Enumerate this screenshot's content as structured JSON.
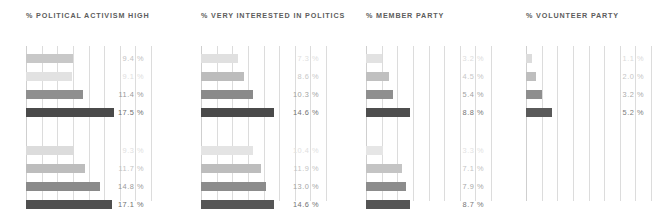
{
  "chart_data": {
    "type": "bar",
    "title": "",
    "orientation": "horizontal",
    "layout": "small-multiples",
    "grid": true,
    "gridline_count": 9,
    "legend": "none",
    "xlabel": "",
    "ylabel": "",
    "xlim": [
      0,
      24
    ],
    "value_suffix": "%",
    "group_count": 2,
    "bars_per_group": 4,
    "panels": [
      {
        "title": "% POLITICAL ACTIVISM HIGH",
        "groups": [
          {
            "values": [
              9.4,
              9.1,
              11.4,
              17.5
            ],
            "labels": [
              "9.4 %",
              "9.1 %",
              "11.4 %",
              "17.5 %"
            ],
            "shades": [
              "#c8c8c8",
              "#e2e2e2",
              "#8f8f8f",
              "#4a4a4a"
            ],
            "label_shades": [
              "#c2c2c2",
              "#dedede",
              "#9a9a9a",
              "#6f6f6f"
            ]
          },
          {
            "values": [
              9.3,
              11.7,
              14.8,
              17.1
            ],
            "labels": [
              "9.3 %",
              "11.7 %",
              "14.8 %",
              "17.1 %"
            ],
            "shades": [
              "#dcdcdc",
              "#bdbdbd",
              "#8a8a8a",
              "#4f4f4f"
            ],
            "label_shades": [
              "#e0e0e0",
              "#c2c2c2",
              "#9a9a9a",
              "#6f6f6f"
            ]
          }
        ]
      },
      {
        "title": "% VERY INTERESTED IN POLITICS",
        "groups": [
          {
            "values": [
              7.3,
              8.6,
              10.3,
              14.6
            ],
            "labels": [
              "7.3 %",
              "8.6 %",
              "10.3 %",
              "14.6 %"
            ],
            "shades": [
              "#e0e0e0",
              "#bcbcbc",
              "#8a8a8a",
              "#4a4a4a"
            ],
            "label_shades": [
              "#dedede",
              "#c8c8c8",
              "#a2a2a2",
              "#727272"
            ]
          },
          {
            "values": [
              10.4,
              11.9,
              13.0,
              14.6
            ],
            "labels": [
              "10.4 %",
              "11.9 %",
              "13.0 %",
              "14.6 %"
            ],
            "shades": [
              "#e4e4e4",
              "#bdbdbd",
              "#8c8c8c",
              "#565656"
            ],
            "label_shades": [
              "#e0e0e0",
              "#c4c4c4",
              "#a4a4a4",
              "#727272"
            ]
          }
        ]
      },
      {
        "title": "% MEMBER PARTY",
        "groups": [
          {
            "values": [
              3.2,
              4.5,
              5.4,
              8.8
            ],
            "labels": [
              "3.2 %",
              "4.5 %",
              "5.4 %",
              "8.8 %"
            ],
            "shades": [
              "#e2e2e2",
              "#c0c0c0",
              "#8f8f8f",
              "#4e4e4e"
            ],
            "label_shades": [
              "#dcdcdc",
              "#c6c6c6",
              "#a2a2a2",
              "#767676"
            ]
          },
          {
            "values": [
              3.3,
              7.1,
              7.9,
              8.7
            ],
            "labels": [
              "3.3 %",
              "7.1 %",
              "7.9 %",
              "8.7 %"
            ],
            "shades": [
              "#e6e6e6",
              "#c4c4c4",
              "#8c8c8c",
              "#545454"
            ],
            "label_shades": [
              "#e2e2e2",
              "#c4c4c4",
              "#a6a6a6",
              "#767676"
            ]
          }
        ]
      },
      {
        "title": "% VOLUNTEER PARTY",
        "groups": [
          {
            "values": [
              1.1,
              2.0,
              3.2,
              5.2
            ],
            "labels": [
              "1.1 %",
              "2.0 %",
              "3.2 %",
              "5.2 %"
            ],
            "shades": [
              "#dcdcdc",
              "#bebebe",
              "#8e8e8e",
              "#5a5a5a"
            ],
            "label_shades": [
              "#dadada",
              "#c6c6c6",
              "#aaaaaa",
              "#7c7c7c"
            ]
          },
          {
            "values": [],
            "labels": [],
            "shades": [],
            "label_shades": []
          }
        ]
      }
    ]
  },
  "style": {
    "background": "#ffffff",
    "gridline_color": "#dcdcdc",
    "title_color": "#5d5d5d"
  }
}
